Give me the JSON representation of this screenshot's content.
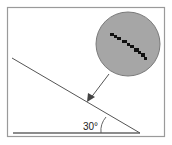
{
  "diagram": {
    "title": "",
    "angle_label": "30°",
    "elements": {
      "frame": {
        "description": "rectangular border"
      },
      "incline": {
        "description": "inclined plane line at 30 degrees"
      },
      "ground": {
        "description": "horizontal ground line"
      },
      "magnifier": {
        "description": "gray circular magnified view showing a dotted black diagonal line"
      },
      "arrow": {
        "description": "arrow pointing from magnifier to incline surface"
      },
      "angle_arc": {
        "description": "arc marking the angle between incline and ground"
      }
    },
    "colors": {
      "frame": "#9a9a9a",
      "line": "#555555",
      "ground": "#666666",
      "magnifier_fill": "#a6a6a6",
      "magnifier_stroke": "#7a7a7a",
      "dots": "#111111",
      "background": "#ffffff"
    }
  }
}
